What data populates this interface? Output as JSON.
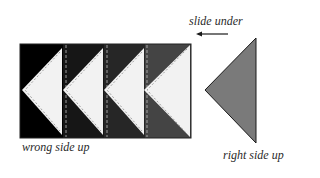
{
  "labels": {
    "slide_under": "slide under",
    "wrong_side_up": "wrong side up",
    "right_side_up": "right side up"
  },
  "strip": {
    "panels": [
      {
        "index": 1,
        "fill": "#000000"
      },
      {
        "index": 2,
        "fill": "#161616"
      },
      {
        "index": 3,
        "fill": "#262626"
      },
      {
        "index": 4,
        "fill": "#444444"
      }
    ],
    "triangle_fill": "#f2f2f2",
    "stitch_color": "#9a9a9a"
  },
  "loose_triangle": {
    "fill": "#7a7a7a",
    "stroke": "#1a1a1a"
  },
  "arrow": {
    "direction": "left",
    "color": "#1a1a1a"
  }
}
